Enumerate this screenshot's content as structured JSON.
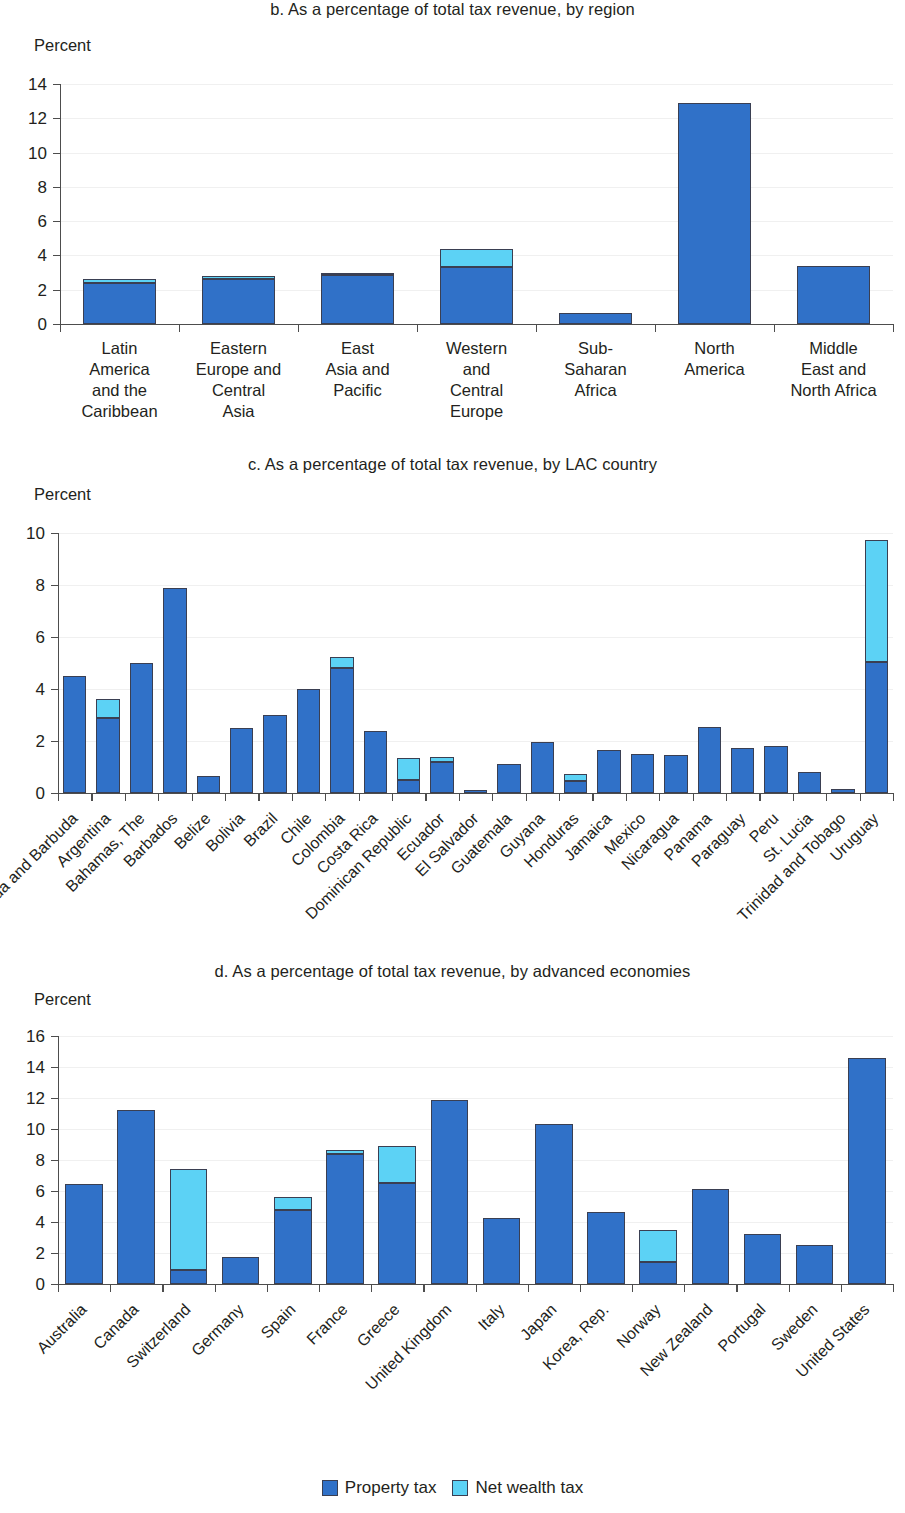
{
  "legend": {
    "items": [
      {
        "label": "Property tax",
        "color": "#3071c8",
        "key": "property"
      },
      {
        "label": "Net wealth tax",
        "color": "#5cd2f5",
        "key": "wealth"
      }
    ]
  },
  "panels": {
    "b": {
      "title": "b. As a percentage of total tax revenue, by region",
      "axis_unit": "Percent"
    },
    "c": {
      "title": "c. As a percentage of total tax revenue, by LAC country",
      "axis_unit": "Percent"
    },
    "d": {
      "title": "d. As a percentage of total tax revenue, by advanced economies",
      "axis_unit": "Percent"
    }
  },
  "chart_data": [
    {
      "id": "b",
      "type": "bar",
      "stacked": true,
      "title": "b. As a percentage of total tax revenue, by region",
      "xlabel": "",
      "ylabel": "Percent",
      "ylim": [
        0,
        14
      ],
      "yticks": [
        0,
        2,
        4,
        6,
        8,
        10,
        12,
        14
      ],
      "grid": true,
      "legend_position": "bottom",
      "categories": [
        "Latin America and the Caribbean",
        "Eastern Europe and Central Asia",
        "East Asia and Pacific",
        "Western and Central Europe",
        "Sub-Saharan Africa",
        "North America",
        "Middle East and North Africa"
      ],
      "category_lines": [
        [
          "Latin",
          "America",
          "and the",
          "Caribbean"
        ],
        [
          "Eastern",
          "Europe and",
          "Central",
          "Asia"
        ],
        [
          "East",
          "Asia and",
          "Pacific"
        ],
        [
          "Western",
          "and",
          "Central",
          "Europe"
        ],
        [
          "Sub-",
          "Saharan",
          "Africa"
        ],
        [
          "North",
          "America"
        ],
        [
          "Middle",
          "East and",
          "North Africa"
        ]
      ],
      "series": [
        {
          "name": "Property tax",
          "values": [
            2.4,
            2.65,
            2.85,
            3.3,
            0.65,
            12.9,
            3.4
          ]
        },
        {
          "name": "Net wealth tax",
          "values": [
            0.25,
            0.15,
            0.05,
            1.05,
            0.0,
            0.0,
            0.0
          ]
        }
      ]
    },
    {
      "id": "c",
      "type": "bar",
      "stacked": true,
      "title": "c. As a percentage of total tax revenue, by LAC country",
      "xlabel": "",
      "ylabel": "Percent",
      "ylim": [
        0,
        10
      ],
      "yticks": [
        0,
        2,
        4,
        6,
        8,
        10
      ],
      "grid": true,
      "legend_position": "bottom",
      "categories": [
        "Antigua and Barbuda",
        "Argentina",
        "Bahamas, The",
        "Barbados",
        "Belize",
        "Bolivia",
        "Brazil",
        "Chile",
        "Colombia",
        "Costa Rica",
        "Dominican Republic",
        "Ecuador",
        "El Salvador",
        "Guatemala",
        "Guyana",
        "Honduras",
        "Jamaica",
        "Mexico",
        "Nicaragua",
        "Panama",
        "Paraguay",
        "Peru",
        "St. Lucia",
        "Trinidad and Tobago",
        "Uruguay"
      ],
      "series": [
        {
          "name": "Property tax",
          "values": [
            4.5,
            2.9,
            5.0,
            7.9,
            0.65,
            2.5,
            3.0,
            4.0,
            4.8,
            2.4,
            0.5,
            1.2,
            0.1,
            1.1,
            1.95,
            0.45,
            1.65,
            1.5,
            1.45,
            2.55,
            1.75,
            1.8,
            0.8,
            0.15,
            5.05
          ]
        },
        {
          "name": "Net wealth tax",
          "values": [
            0.0,
            0.7,
            0.0,
            0.0,
            0.0,
            0.0,
            0.0,
            0.0,
            0.45,
            0.0,
            0.85,
            0.2,
            0.0,
            0.0,
            0.0,
            0.3,
            0.0,
            0.0,
            0.0,
            0.0,
            0.0,
            0.0,
            0.0,
            0.0,
            4.7
          ]
        }
      ]
    },
    {
      "id": "d",
      "type": "bar",
      "stacked": true,
      "title": "d. As a percentage of total tax revenue, by advanced economies",
      "xlabel": "",
      "ylabel": "Percent",
      "ylim": [
        0,
        16
      ],
      "yticks": [
        0,
        2,
        4,
        6,
        8,
        10,
        12,
        14,
        16
      ],
      "grid": true,
      "legend_position": "bottom",
      "categories": [
        "Australia",
        "Canada",
        "Switzerland",
        "Germany",
        "Spain",
        "France",
        "Greece",
        "United Kingdom",
        "Italy",
        "Japan",
        "Korea, Rep.",
        "Norway",
        "New Zealand",
        "Portugal",
        "Sweden",
        "United States"
      ],
      "series": [
        {
          "name": "Property tax",
          "values": [
            6.45,
            11.25,
            0.9,
            1.75,
            4.8,
            8.4,
            6.5,
            11.85,
            4.25,
            10.3,
            4.65,
            1.45,
            6.1,
            3.25,
            2.5,
            14.55
          ]
        },
        {
          "name": "Net wealth tax",
          "values": [
            0.0,
            0.0,
            6.5,
            0.0,
            0.8,
            0.25,
            2.4,
            0.0,
            0.0,
            0.0,
            0.0,
            2.05,
            0.0,
            0.0,
            0.0,
            0.0
          ]
        }
      ]
    }
  ]
}
